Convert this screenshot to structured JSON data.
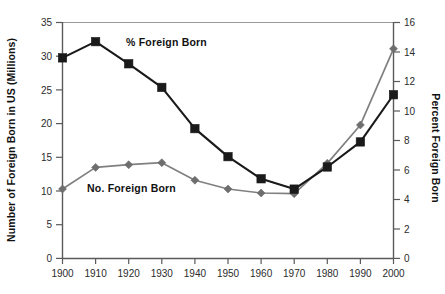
{
  "chart_data": {
    "type": "line",
    "title": "",
    "xlabel": "",
    "categories": [
      "1900",
      "1910",
      "1920",
      "1930",
      "1940",
      "1950",
      "1960",
      "1970",
      "1980",
      "1990",
      "2000"
    ],
    "x": [
      1900,
      1910,
      1920,
      1930,
      1940,
      1950,
      1960,
      1970,
      1980,
      1990,
      2000
    ],
    "grid": false,
    "legend_position": "inline-annotations",
    "axes": {
      "left": {
        "label": "Number of Foreign Born in US (Millions)",
        "ylim": [
          0,
          35
        ],
        "tick_step": 5,
        "ticks": [
          0,
          5,
          10,
          15,
          20,
          25,
          30,
          35
        ],
        "tick_labels": [
          "0",
          "5",
          "10",
          "15",
          "20",
          "25",
          "30",
          "35"
        ]
      },
      "right": {
        "label": "Percent Foreign Born",
        "ylim": [
          0,
          16
        ],
        "tick_step": 2,
        "ticks": [
          0,
          2,
          4,
          6,
          8,
          10,
          12,
          14,
          16
        ],
        "tick_labels": [
          "0",
          "2",
          "4",
          "6",
          "8",
          "10",
          "12",
          "14",
          "16"
        ]
      },
      "bottom": {
        "tick_labels": [
          "1900",
          "1910",
          "1920",
          "1930",
          "1940",
          "1950",
          "1960",
          "1970",
          "1980",
          "1990",
          "2000"
        ]
      }
    },
    "series": [
      {
        "name": "% Foreign Born",
        "axis": "right",
        "marker": "square",
        "color": "#1a1a1a",
        "line_color": "#1a1a1a",
        "values": [
          13.6,
          14.7,
          13.2,
          11.6,
          8.8,
          6.9,
          5.4,
          4.7,
          6.2,
          7.9,
          11.1
        ]
      },
      {
        "name": "No. Foreign Born",
        "axis": "left",
        "marker": "diamond",
        "color": "#6e6e6e",
        "line_color": "#808080",
        "values": [
          10.3,
          13.5,
          13.9,
          14.2,
          11.6,
          10.3,
          9.7,
          9.6,
          14.1,
          19.8,
          31.1
        ]
      }
    ],
    "annotations": [
      {
        "text": "% Foreign Born",
        "x_px": 126,
        "y_px": 46
      },
      {
        "text": "No. Foreign Born",
        "x_px": 87,
        "y_px": 192
      }
    ]
  },
  "labels": {
    "left_axis_title": "Number of Foreign Born in US (Millions)",
    "right_axis_title": "Percent Foreign Born",
    "series_percent": "% Foreign Born",
    "series_number": "No. Foreign Born"
  },
  "colors": {
    "percent_series": "#1a1a1a",
    "number_series": "#6e6e6e",
    "axis": "#5a5a5a",
    "frame": "#9a9a9a",
    "background": "#ffffff"
  }
}
